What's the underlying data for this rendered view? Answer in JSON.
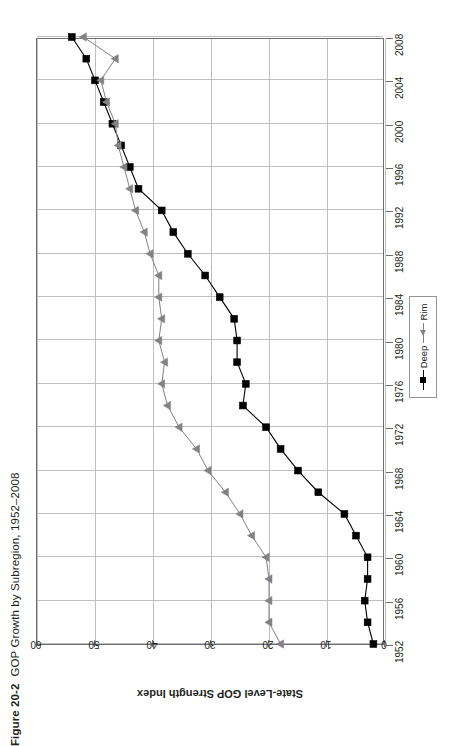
{
  "caption": {
    "number": "Figure 20-2",
    "title": "GOP Growth by Subregion, 1952–2008"
  },
  "legend": {
    "items": [
      {
        "label": "Deep",
        "marker": "square-marker",
        "color": "#000000"
      },
      {
        "label": "Rim",
        "marker": "triangle-marker",
        "color": "#808285"
      }
    ]
  },
  "axes": {
    "value_axis_title": "State-Level GOP Strength Index",
    "value_ticks": [
      "60",
      "50",
      "40",
      "30",
      "20",
      "10",
      "0"
    ],
    "year_ticks": [
      "2008",
      "2004",
      "2000",
      "1996",
      "1992",
      "1988",
      "1984",
      "1980",
      "1976",
      "1972",
      "1968",
      "1964",
      "1960",
      "1956",
      "1952"
    ]
  },
  "colors": {
    "deep_series": "#000000",
    "rim_series": "#808285",
    "grid": "#bcbec0",
    "frame": "#6d6e71",
    "text": "#231f20",
    "background": "#ffffff"
  },
  "chart_data": {
    "type": "line",
    "title": "GOP Growth by Subregion, 1952–2008",
    "xlabel": "",
    "ylabel": "State-Level GOP Strength Index",
    "orientation": "rotated-90-ccw",
    "grid": true,
    "legend_position": "right-middle",
    "xlim": [
      1952,
      2008
    ],
    "ylim": [
      0,
      60
    ],
    "x": [
      1952,
      1954,
      1956,
      1958,
      1960,
      1962,
      1964,
      1966,
      1968,
      1970,
      1972,
      1974,
      1976,
      1978,
      1980,
      1982,
      1984,
      1986,
      1988,
      1990,
      1992,
      1994,
      1996,
      1998,
      2000,
      2002,
      2004,
      2006,
      2008
    ],
    "series": [
      {
        "name": "Deep",
        "color": "#000000",
        "marker": "square",
        "values": [
          2.0,
          3.0,
          3.5,
          3.0,
          3.0,
          5.0,
          7.0,
          11.5,
          15.0,
          18.0,
          20.5,
          24.5,
          24.0,
          25.5,
          25.5,
          26.0,
          28.5,
          31.0,
          34.0,
          36.5,
          38.5,
          42.5,
          44.0,
          45.5,
          47.0,
          48.5,
          50.0,
          51.5,
          54.0
        ]
      },
      {
        "name": "Rim",
        "color": "#808285",
        "marker": "triangle",
        "values": [
          18.0,
          20.0,
          20.0,
          20.0,
          20.5,
          23.0,
          25.0,
          27.5,
          30.5,
          32.5,
          35.5,
          37.5,
          38.5,
          38.0,
          39.0,
          38.5,
          39.0,
          39.0,
          40.5,
          41.5,
          43.0,
          44.0,
          45.0,
          46.0,
          46.5,
          48.0,
          49.0,
          46.5,
          52.0
        ]
      }
    ]
  }
}
